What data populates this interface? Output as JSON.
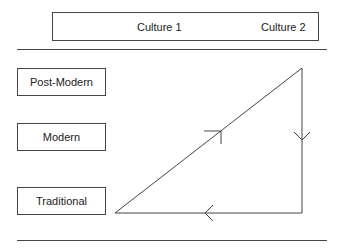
{
  "header": {
    "columns": [
      "Culture 1",
      "Culture 2"
    ]
  },
  "levels": [
    {
      "label": "Post-Modern"
    },
    {
      "label": "Modern"
    },
    {
      "label": "Traditional"
    }
  ],
  "cycle": {
    "description": "Triangle path: Traditional (Culture 1) up to Post-Modern (Culture 2), down to Traditional (Culture 2), back left to start",
    "arrows": [
      "up-right along diagonal",
      "down along right edge",
      "left along bottom edge"
    ]
  },
  "colors": {
    "line": "#444444",
    "text": "#222222"
  }
}
